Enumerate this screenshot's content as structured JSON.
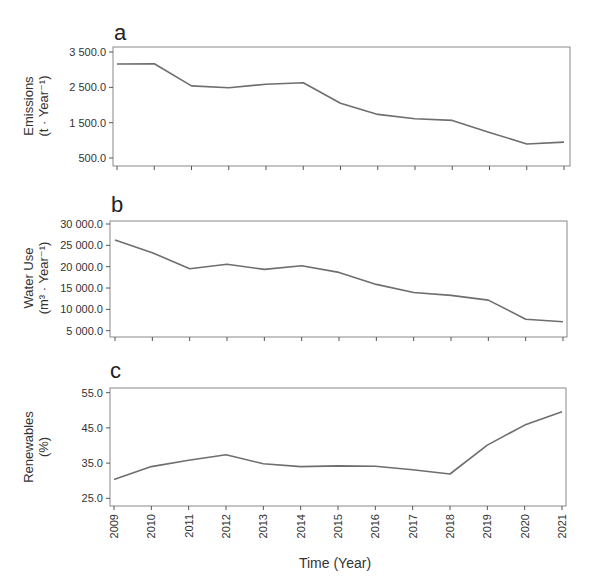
{
  "figure": {
    "x_axis_title": "Time (Year)",
    "x_tick_labels": [
      "2009",
      "2010",
      "2011",
      "2012",
      "2013",
      "2014",
      "2015",
      "2016",
      "2017",
      "2018",
      "2019",
      "2020",
      "2021"
    ]
  },
  "panels": [
    {
      "letter": "a",
      "ylabel_line1": "Emissions",
      "ylabel_line2": "(t · Year⁻¹)",
      "y_tick_labels": [
        "3 500.0",
        "2 500.0",
        "1 500.0",
        "500.0"
      ]
    },
    {
      "letter": "b",
      "ylabel_line1": "Water Use",
      "ylabel_line2": "(m³ · Year⁻¹)",
      "y_tick_labels": [
        "30 000.0",
        "25 000.0",
        "20 000.0",
        "15 000.0",
        "10 000.0",
        "5 000.0"
      ]
    },
    {
      "letter": "c",
      "ylabel_line1": "Renewables",
      "ylabel_line2": "(%)",
      "y_tick_labels": [
        "55.0",
        "45.0",
        "35.0",
        "25.0"
      ]
    }
  ],
  "chart_data": [
    {
      "type": "line",
      "title": "a",
      "xlabel": "Time (Year)",
      "ylabel": "Emissions (t · Year⁻¹)",
      "x": [
        2009,
        2010,
        2011,
        2012,
        2013,
        2014,
        2015,
        2016,
        2017,
        2018,
        2019,
        2020,
        2021
      ],
      "series": [
        {
          "name": "Emissions",
          "values": [
            3160,
            3170,
            2540,
            2490,
            2590,
            2630,
            2050,
            1735,
            1610,
            1565,
            1225,
            895,
            950
          ]
        }
      ],
      "yticks": [
        500,
        1500,
        2500,
        3500
      ],
      "ylim": [
        400,
        3650
      ],
      "grid": false,
      "legend": "none",
      "color": "#6e6e6e"
    },
    {
      "type": "line",
      "title": "b",
      "xlabel": "Time (Year)",
      "ylabel": "Water Use (m³ · Year⁻¹)",
      "x": [
        2009,
        2010,
        2011,
        2012,
        2013,
        2014,
        2015,
        2016,
        2017,
        2018,
        2019,
        2020,
        2021
      ],
      "series": [
        {
          "name": "Water Use",
          "values": [
            26250,
            23270,
            19530,
            20560,
            19360,
            20200,
            18660,
            15840,
            13960,
            13260,
            12160,
            7700,
            7080
          ]
        }
      ],
      "yticks": [
        5000,
        10000,
        15000,
        20000,
        25000,
        30000
      ],
      "ylim": [
        4000,
        30200
      ],
      "grid": false,
      "legend": "none",
      "color": "#6e6e6e"
    },
    {
      "type": "line",
      "title": "c",
      "xlabel": "Time (Year)",
      "ylabel": "Renewables (%)",
      "x": [
        2009,
        2010,
        2011,
        2012,
        2013,
        2014,
        2015,
        2016,
        2017,
        2018,
        2019,
        2020,
        2021
      ],
      "series": [
        {
          "name": "Renewables",
          "values": [
            30.3,
            34.0,
            35.8,
            37.4,
            34.8,
            34.0,
            34.2,
            34.1,
            33.1,
            31.9,
            40.1,
            45.8,
            49.6
          ]
        }
      ],
      "yticks": [
        25,
        35,
        45,
        55
      ],
      "ylim": [
        24,
        55.5
      ],
      "grid": false,
      "legend": "none",
      "color": "#6e6e6e"
    }
  ]
}
